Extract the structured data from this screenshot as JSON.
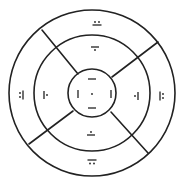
{
  "diagram": {
    "type": "concentric-ring-sector-diagram",
    "stroke_color": "#222222",
    "background": "#ffffff",
    "center": [
      92,
      93
    ],
    "rings": [
      {
        "name": "outer",
        "radius": 83
      },
      {
        "name": "middle",
        "radius": 58
      },
      {
        "name": "inner",
        "radius": 24
      }
    ],
    "dividers": [
      {
        "name": "upper-left",
        "from": [
          78,
          74
        ],
        "to": [
          42,
          30
        ]
      },
      {
        "name": "upper-right",
        "from": [
          112,
          77
        ],
        "to": [
          158,
          42
        ]
      },
      {
        "name": "lower-right",
        "from": [
          111,
          112
        ],
        "to": [
          148,
          153
        ]
      },
      {
        "name": "lower-left",
        "from": [
          73,
          111
        ],
        "to": [
          29,
          144
        ]
      }
    ],
    "glyphs": {
      "center": {
        "description": "dot",
        "pos": [
          92,
          94
        ]
      },
      "inner_top": {
        "description": "horizontal bar",
        "pos": [
          92,
          79
        ]
      },
      "inner_bottom": {
        "description": "horizontal bar",
        "pos": [
          92,
          108
        ]
      },
      "inner_left": {
        "description": "vertical bar",
        "pos": [
          78,
          94
        ]
      },
      "inner_right": {
        "description": "vertical bar",
        "pos": [
          111,
          94
        ]
      },
      "middle_top": {
        "description": "bar with dot below",
        "pos": [
          95,
          47
        ]
      },
      "middle_bottom": {
        "description": "bar with dot above",
        "pos": [
          91,
          135
        ]
      },
      "middle_left": {
        "description": "vertical bar with dot right",
        "pos": [
          44,
          95
        ]
      },
      "middle_right": {
        "description": "vertical bar with dot left",
        "pos": [
          138,
          96
        ]
      },
      "outer_top": {
        "description": "bar with two dots above",
        "pos": [
          97,
          23
        ]
      },
      "outer_bottom": {
        "description": "bar with two dots below",
        "pos": [
          92,
          162
        ]
      },
      "outer_left": {
        "description": "vertical bar with two dots left",
        "pos": [
          21,
          95
        ]
      },
      "outer_right": {
        "description": "vertical bar with two dots right",
        "pos": [
          162,
          96
        ]
      }
    }
  }
}
